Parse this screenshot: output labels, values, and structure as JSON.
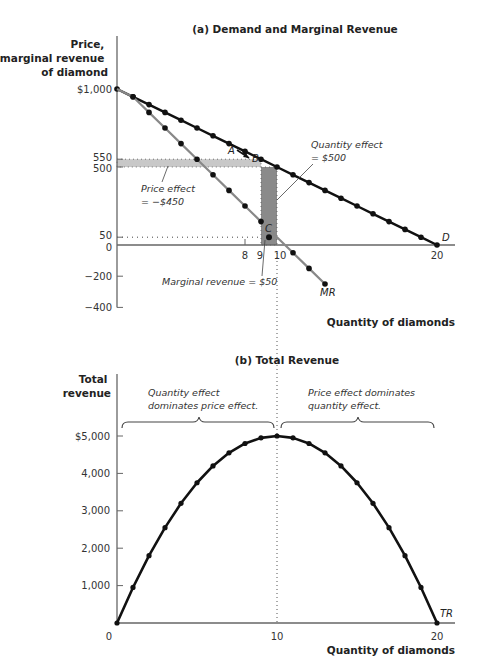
{
  "chart_data": [
    {
      "type": "line",
      "panel": "a",
      "title": "(a) Demand and Marginal Revenue",
      "xlabel": "Quantity of diamonds",
      "ylabel": [
        "Price,",
        "marginal revenue",
        "of diamond"
      ],
      "xlim": [
        0,
        20
      ],
      "ylim": [
        -400,
        1000
      ],
      "x_ticks": [
        {
          "value": 8,
          "label": "8"
        },
        {
          "value": 9,
          "label": "9"
        },
        {
          "value": 10,
          "label": "10"
        },
        {
          "value": 20,
          "label": "20"
        }
      ],
      "y_ticks": [
        {
          "value": 1000,
          "label": "$1,000"
        },
        {
          "value": 550,
          "label": "550"
        },
        {
          "value": 500,
          "label": "500"
        },
        {
          "value": 50,
          "label": "50"
        },
        {
          "value": 0,
          "label": "0"
        },
        {
          "value": -200,
          "label": "−200"
        },
        {
          "value": -400,
          "label": "−400"
        }
      ],
      "series": [
        {
          "name": "D",
          "label": "D",
          "color": "#111111",
          "x": [
            0,
            1,
            2,
            3,
            4,
            5,
            6,
            7,
            8,
            9,
            10,
            11,
            12,
            13,
            14,
            15,
            16,
            17,
            18,
            19,
            20
          ],
          "values": [
            1000,
            950,
            900,
            850,
            800,
            750,
            700,
            650,
            600,
            550,
            500,
            450,
            400,
            350,
            300,
            250,
            200,
            150,
            100,
            50,
            0
          ]
        },
        {
          "name": "MR",
          "label": "MR",
          "color": "#888888",
          "x": [
            0,
            1,
            2,
            3,
            4,
            5,
            6,
            7,
            8,
            9,
            10,
            11,
            12,
            13
          ],
          "values": [
            1000,
            950,
            850,
            750,
            650,
            550,
            450,
            350,
            250,
            150,
            50,
            -50,
            -150,
            -250
          ],
          "marker_x": [
            1,
            2,
            3,
            4,
            5,
            6,
            7,
            8,
            9,
            11,
            12,
            13
          ],
          "marker_values": [
            950,
            850,
            750,
            650,
            550,
            450,
            350,
            250,
            150,
            -50,
            -150,
            -250
          ]
        }
      ],
      "points": [
        {
          "label": "A",
          "x": 9,
          "y": 550
        },
        {
          "label": "B",
          "x": 10,
          "y": 500
        },
        {
          "label": "C",
          "x": 9.5,
          "y": 50
        }
      ],
      "shaded_areas": [
        {
          "name": "price-effect",
          "x0": 0,
          "x1": 9,
          "y0": 500,
          "y1": 550,
          "color": "#c8c8c8"
        },
        {
          "name": "quantity-effect",
          "x0": 9,
          "x1": 10,
          "y0": 0,
          "y1": 500,
          "color": "#8a8a8a"
        }
      ],
      "annotations": [
        {
          "id": "quantity-effect",
          "lines": [
            "Quantity effect",
            "= $500"
          ]
        },
        {
          "id": "price-effect",
          "lines": [
            "Price effect",
            "= −$450"
          ]
        },
        {
          "id": "marginal-revenue",
          "lines": [
            "Marginal revenue = $50"
          ]
        }
      ]
    },
    {
      "type": "line",
      "panel": "b",
      "title": "(b) Total Revenue",
      "xlabel": "Quantity of diamonds",
      "ylabel": [
        "Total",
        "revenue"
      ],
      "xlim": [
        0,
        20
      ],
      "ylim": [
        0,
        5000
      ],
      "x_ticks": [
        {
          "value": 0,
          "label": "0"
        },
        {
          "value": 10,
          "label": "10"
        },
        {
          "value": 20,
          "label": "20"
        }
      ],
      "y_ticks": [
        {
          "value": 5000,
          "label": "$5,000"
        },
        {
          "value": 4000,
          "label": "4,000"
        },
        {
          "value": 3000,
          "label": "3,000"
        },
        {
          "value": 2000,
          "label": "2,000"
        },
        {
          "value": 1000,
          "label": "1,000"
        }
      ],
      "series": [
        {
          "name": "TR",
          "label": "TR",
          "color": "#111111",
          "x": [
            0,
            1,
            2,
            3,
            4,
            5,
            6,
            7,
            8,
            9,
            10,
            11,
            12,
            13,
            14,
            15,
            16,
            17,
            18,
            19,
            20
          ],
          "values": [
            0,
            950,
            1800,
            2550,
            3200,
            3750,
            4200,
            4550,
            4800,
            4950,
            5000,
            4950,
            4800,
            4550,
            4200,
            3750,
            3200,
            2550,
            1800,
            950,
            0
          ]
        }
      ],
      "annotations": [
        {
          "id": "left-brace",
          "lines": [
            "Quantity effect",
            "dominates price effect."
          ]
        },
        {
          "id": "right-brace",
          "lines": [
            "Price effect dominates",
            "quantity effect."
          ]
        }
      ]
    }
  ]
}
